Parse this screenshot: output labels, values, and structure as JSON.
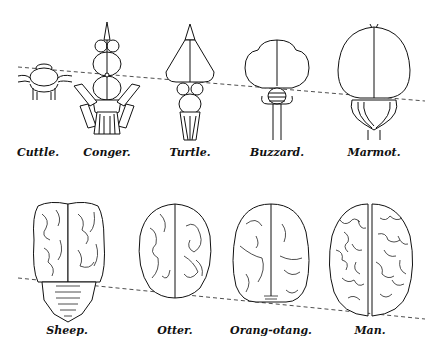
{
  "figure": {
    "rows": [
      {
        "row": "top",
        "specimens": [
          {
            "label": "Cuttle.",
            "x": 38
          },
          {
            "label": "Conger.",
            "x": 107
          },
          {
            "label": "Turtle.",
            "x": 190
          },
          {
            "label": "Buzzard.",
            "x": 277
          },
          {
            "label": "Marmot.",
            "x": 374
          }
        ]
      },
      {
        "row": "bottom",
        "specimens": [
          {
            "label": "Sheep.",
            "x": 67
          },
          {
            "label": "Otter.",
            "x": 175
          },
          {
            "label": "Orang-otang.",
            "x": 271
          },
          {
            "label": "Man.",
            "x": 370
          }
        ]
      }
    ],
    "reference_line_style": "dashed"
  }
}
